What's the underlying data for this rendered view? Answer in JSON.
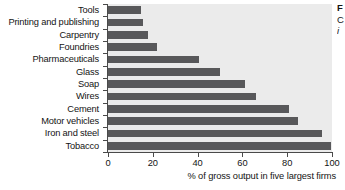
{
  "chart_data": {
    "type": "bar",
    "orientation": "horizontal",
    "title": "",
    "xlabel": "% of gross output in five largest firms",
    "ylabel": "",
    "xlim": [
      0,
      100
    ],
    "xticks": [
      0,
      20,
      40,
      60,
      80,
      100
    ],
    "grid": false,
    "legend": "none",
    "bar_color": "#58585a",
    "plot_background": "#ebebeb",
    "categories": [
      "Tools",
      "Printing and publishing",
      "Carpentry",
      "Foundries",
      "Pharmaceuticals",
      "Glass",
      "Soap",
      "Wires",
      "Cement",
      "Motor vehicles",
      "Iron and steel",
      "Tobacco"
    ],
    "values": [
      14.7,
      15.5,
      18,
      22,
      40.5,
      50,
      61,
      66,
      81,
      85,
      95.5,
      99.5
    ]
  },
  "caption": {
    "line1": "F",
    "line2": "C",
    "line3": "i"
  }
}
